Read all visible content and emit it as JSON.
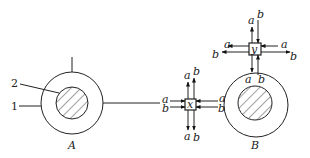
{
  "diagram": {
    "nodes": [
      {
        "id": "A",
        "label": "A",
        "type": "ring-with-hatched-core"
      },
      {
        "id": "B",
        "label": "B",
        "type": "ring-with-hatched-core"
      },
      {
        "id": "x",
        "label": "x",
        "type": "junction-box"
      },
      {
        "id": "y",
        "label": "y",
        "type": "junction-box"
      }
    ],
    "callouts": [
      {
        "label": "1",
        "target": "outer ring of A"
      },
      {
        "label": "2",
        "target": "hatched core of A"
      }
    ],
    "signals": {
      "a": "a",
      "b": "b"
    },
    "junction_x": {
      "label": "x",
      "left": {
        "a": "a",
        "b": "b",
        "direction": "in"
      },
      "right": {
        "a": "a",
        "b": "b",
        "direction": "in"
      },
      "top": {
        "a": "a",
        "b": "b",
        "direction": "out"
      },
      "bottom": {
        "a": "a",
        "b": "b",
        "direction": "out"
      }
    },
    "junction_y": {
      "label": "y",
      "left": {
        "a": "a",
        "b": "b",
        "direction": "out"
      },
      "right": {
        "a": "a",
        "b": "b",
        "a_direction": "in",
        "b_direction": "out"
      },
      "top": {
        "a": "a",
        "b": "b",
        "a_direction": "out",
        "b_direction": "in"
      },
      "bottom": {
        "a": "a",
        "b": "b",
        "a_direction": "out",
        "b_direction": "in"
      }
    }
  }
}
